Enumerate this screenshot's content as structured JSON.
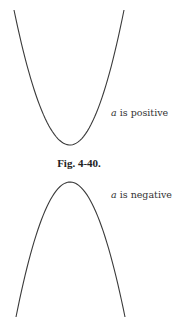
{
  "figure": {
    "caption": "Fig. 4-40.",
    "panels": [
      {
        "id": "upward",
        "label_var": "a",
        "label_text": " is positive",
        "shape": "parabola opening upward",
        "vertex": [
          70,
          145
        ],
        "endpoints": [
          [
            14,
            10
          ],
          [
            124,
            10
          ]
        ]
      },
      {
        "id": "downward",
        "label_var": "a",
        "label_text": " is negative",
        "shape": "parabola opening downward",
        "vertex": [
          70,
          182
        ],
        "endpoints": [
          [
            16,
            317
          ],
          [
            125,
            317
          ]
        ]
      }
    ],
    "colors": {
      "curve": "#3a3a3a",
      "text": "#333333",
      "background": "#ffffff"
    }
  }
}
